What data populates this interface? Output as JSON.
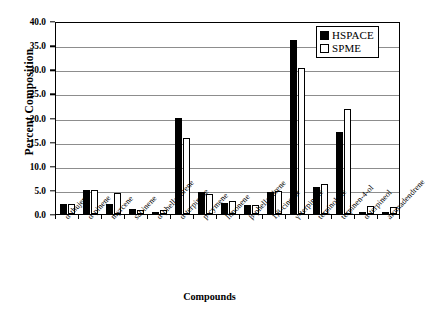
{
  "chart_data": {
    "type": "bar",
    "title": "",
    "xlabel": "Compounds",
    "ylabel": "Percent Composition",
    "ylim": [
      0,
      40
    ],
    "ytick_step": 5,
    "ytick_labels": [
      "0.0",
      "5.0",
      "10.0",
      "15.0",
      "20.0",
      "25.0",
      "30.0",
      "35.0",
      "40.0"
    ],
    "grid": "horizontal",
    "legend_position": "top-right",
    "categories": [
      "α-thujene",
      "α-pinene",
      "myrcene",
      "sabinene",
      "α-phellandrene",
      "α-terpinene",
      "p-cymene",
      "limonene",
      "β-phellandrene",
      "1,8-cineole",
      "γ-terpinene",
      "terpinolene",
      "terpinen-4-ol",
      "α-terpineol",
      "aromadendrene"
    ],
    "series": [
      {
        "name": "HSPACE",
        "color": "#000000",
        "fill": "solid",
        "values": [
          2.0,
          5.0,
          2.0,
          1.0,
          0.3,
          20.0,
          4.6,
          2.2,
          1.9,
          4.5,
          36.0,
          5.7,
          17.1,
          0.4,
          0.3
        ]
      },
      {
        "name": "SPME",
        "color": "#ffffff",
        "fill": "open",
        "values": [
          2.1,
          4.9,
          4.3,
          0.9,
          0.8,
          15.7,
          4.1,
          2.7,
          1.9,
          4.7,
          30.3,
          6.3,
          21.7,
          1.7,
          1.5
        ]
      }
    ]
  }
}
